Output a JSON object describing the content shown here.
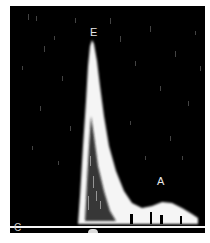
{
  "image": {
    "description": "Doppler spectral waveform of mitral inflow",
    "background_color": "#000000",
    "signal_color": "#ffffff",
    "labels": {
      "e_wave": "E",
      "a_wave": "A",
      "baseline": "C"
    }
  }
}
